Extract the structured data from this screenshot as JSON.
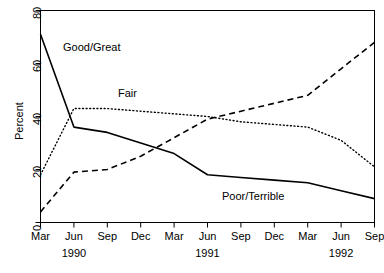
{
  "chart_data": {
    "type": "line",
    "title": "",
    "subtitle": "",
    "xlabel": "",
    "ylabel": "Percent",
    "ylim": [
      0,
      80
    ],
    "yticks": [
      0,
      20,
      40,
      60,
      80
    ],
    "ytick_labels": [
      "0",
      "20",
      "40",
      "60",
      "80"
    ],
    "grid": false,
    "legend_position": "inline-annotations",
    "x": [
      "Mar 1990",
      "Jun 1990",
      "Sep 1990",
      "Dec 1990",
      "Mar 1991",
      "Jun 1991",
      "Sep 1991",
      "Dec 1991",
      "Mar 1992",
      "Jun 1992",
      "Sep 1992"
    ],
    "xtick_labels": [
      "Mar",
      "Jun",
      "Sep",
      "Dec",
      "Mar",
      "Jun",
      "Sep",
      "Dec",
      "Mar",
      "Jun",
      "Sep"
    ],
    "year_labels": [
      {
        "text": "1990",
        "tick_index": 1
      },
      {
        "text": "1991",
        "tick_index": 5
      },
      {
        "text": "1992",
        "tick_index": 9
      }
    ],
    "series": [
      {
        "name": "Good/Great",
        "style": "solid",
        "color": "#000000",
        "values": [
          71,
          36,
          34,
          30,
          26,
          18,
          17,
          16,
          15,
          12,
          9
        ]
      },
      {
        "name": "Fair",
        "style": "dotted",
        "color": "#000000",
        "values": [
          18,
          43,
          43,
          42,
          41,
          40,
          38,
          37,
          36,
          31,
          21
        ]
      },
      {
        "name": "Poor/Terrible",
        "style": "dashed",
        "color": "#000000",
        "values": [
          4,
          19,
          20,
          25,
          32,
          39,
          42,
          45,
          48,
          58,
          68
        ]
      }
    ],
    "annotations": [
      {
        "text": "Good/Great",
        "x_px": 63,
        "y_px": 42
      },
      {
        "text": "Fair",
        "x_px": 118,
        "y_px": 88
      },
      {
        "text": "Poor/Terrible",
        "x_px": 222,
        "y_px": 191
      }
    ]
  },
  "colors": {
    "background": "#ffffff",
    "axis": "#000000",
    "series": "#000000"
  }
}
